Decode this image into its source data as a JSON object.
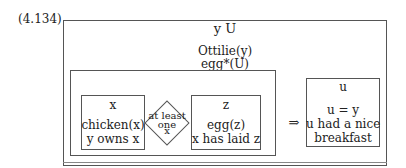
{
  "equation_label": "(4.134)",
  "outer_box": {
    "referents": "y  U",
    "conditions": [
      "Ottilie(y)",
      "egg*(U)"
    ]
  },
  "antecedent_box": {
    "left_box": {
      "referent": "x",
      "conditions": [
        "chicken(x)",
        "y owns x"
      ]
    },
    "quantifier": {
      "lines": [
        "at least",
        "one",
        "x"
      ]
    },
    "right_box": {
      "referent": "z",
      "conditions": [
        "egg(z)",
        "x has laid z"
      ]
    }
  },
  "implication_symbol": "⇒",
  "consequent_box": {
    "referent": "u",
    "conditions": [
      "u = y",
      "u had a nice",
      "breakfast"
    ]
  }
}
